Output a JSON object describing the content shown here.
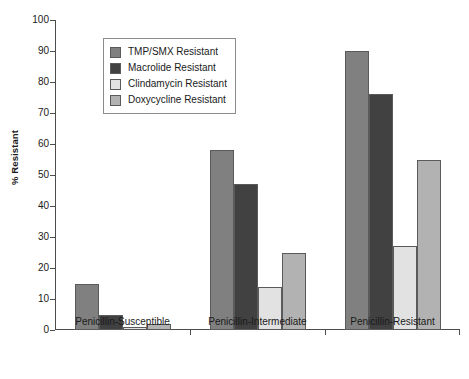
{
  "chart_data": {
    "type": "bar",
    "title": "",
    "xlabel": "",
    "ylabel": "% Resistant",
    "ylim": [
      0,
      100
    ],
    "yticks": [
      0,
      10,
      20,
      30,
      40,
      50,
      60,
      70,
      80,
      90,
      100
    ],
    "grid": false,
    "legend_position": "upper-left-inside",
    "categories": [
      "Penicillin-Susceptible",
      "Penicillin-Intermediate",
      "Penicillin-Resistant"
    ],
    "series": [
      {
        "name": "TMP/SMX Resistant",
        "color": "#808080",
        "values": [
          15,
          58,
          90
        ]
      },
      {
        "name": "Macrolide Resistant",
        "color": "#414141",
        "values": [
          5,
          47,
          76
        ]
      },
      {
        "name": "Clindamycin Resistant",
        "color": "#e2e2e2",
        "values": [
          1,
          14,
          27
        ]
      },
      {
        "name": "Doxycycline Resistant",
        "color": "#b2b2b2",
        "values": [
          2,
          25,
          55
        ]
      }
    ]
  }
}
